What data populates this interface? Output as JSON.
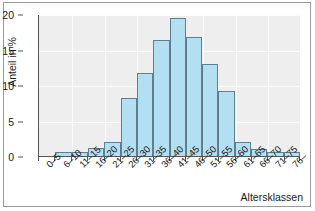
{
  "chart_data": {
    "type": "bar",
    "title": "",
    "xlabel": "Altersklassen",
    "ylabel": "Anteil in %",
    "categories": [
      "0–5",
      "6–10",
      "11–15",
      "16–20",
      "21–25",
      "26–30",
      "31–35",
      "36–40",
      "41–45",
      "46–50",
      "51–55",
      "56–60",
      "61–65",
      "66–70",
      "71–75",
      "76–"
    ],
    "values": [
      0,
      0.6,
      0.6,
      1.1,
      2.0,
      8.2,
      11.7,
      16.4,
      19.4,
      16.8,
      12.9,
      9.2,
      2.0,
      1.0,
      0.5,
      0.5
    ],
    "ylim": [
      0,
      20
    ],
    "y_ticks": [
      0,
      5,
      10,
      15,
      20
    ],
    "y_tick_labels": [
      "0",
      "5",
      "10",
      "15",
      "20"
    ],
    "grid": true,
    "legend": null,
    "bar_fill_color": "#b2dff2",
    "bar_edge_color": "#5f7f8c",
    "plot_background_color": "#eeeeee",
    "axis_color": "#555555",
    "gridline_color": "#fbfbfb"
  }
}
